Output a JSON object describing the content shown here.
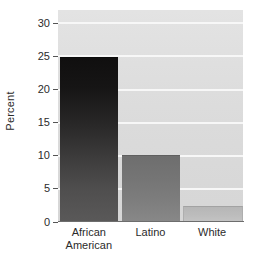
{
  "chart_data": {
    "type": "bar",
    "title": "",
    "subtitle": "",
    "xlabel": "",
    "ylabel": "Percent",
    "categories": [
      "African American",
      "Latino",
      "White"
    ],
    "category_lines": [
      [
        "African",
        "American"
      ],
      [
        "Latino",
        ""
      ],
      [
        "White",
        ""
      ]
    ],
    "values": [
      24.8,
      9.9,
      2.3
    ],
    "ylim": [
      0,
      32
    ],
    "yticks": [
      0,
      5,
      10,
      15,
      20,
      25,
      30
    ],
    "ytick_labels": [
      "0",
      "5",
      "10",
      "15",
      "20",
      "25",
      "30"
    ],
    "grid": true,
    "gridlines_at": [
      5,
      10,
      15,
      20,
      25,
      30
    ],
    "legend": "none",
    "legend_position": "none",
    "bar_colors": [
      "#1a1919",
      "#787878",
      "#bdbdbd"
    ],
    "plot_background": "#dedede",
    "gridline_color": "#f7f7f7",
    "axis_color": "#6d6d6d",
    "text_color": "#2b2b2b"
  },
  "axis": {
    "y_title": "Percent"
  }
}
